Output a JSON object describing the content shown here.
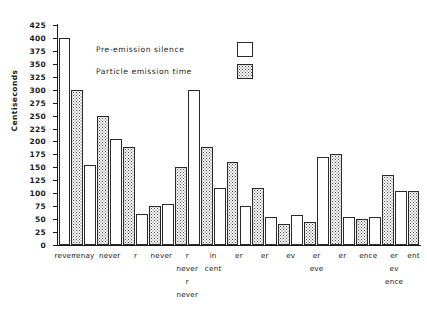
{
  "chart_data": {
    "type": "bar",
    "title": "",
    "xlabel": "",
    "ylabel": "Centiseconds",
    "ylim": [
      0,
      425
    ],
    "ytick_step": 25,
    "yticks": [
      0,
      25,
      50,
      75,
      100,
      125,
      150,
      175,
      200,
      225,
      250,
      275,
      300,
      325,
      350,
      375,
      400,
      425
    ],
    "ytick_labels": [
      "0",
      "25",
      "50",
      "75",
      "100",
      "125",
      "150",
      "175",
      "200",
      "225",
      "250",
      "275",
      "300",
      "325",
      "350",
      "375",
      "400",
      "425"
    ],
    "grid": false,
    "legend_position": "upper-center-inside",
    "categories": [
      "rever",
      "renay",
      "never",
      "r",
      "never",
      "r",
      "in",
      "er",
      "er",
      "ev",
      "er",
      "er",
      "ence",
      "er",
      "ent"
    ],
    "category_label_lines": [
      [
        "rever"
      ],
      [
        "renay"
      ],
      [
        "never"
      ],
      [
        "r"
      ],
      [
        "never"
      ],
      [
        "r",
        "never",
        "r",
        "never"
      ],
      [
        "in",
        "cent"
      ],
      [
        "er"
      ],
      [
        "er"
      ],
      [
        "ev"
      ],
      [
        "er",
        "eve"
      ],
      [
        "er"
      ],
      [
        "ence"
      ],
      [
        "er",
        "ev",
        "ence"
      ],
      [
        "ent"
      ]
    ],
    "series": [
      {
        "name": "Pre-emission silence",
        "fill": "white",
        "values": [
          400,
          155,
          205,
          60,
          80,
          300,
          110,
          75,
          55,
          58,
          170,
          55,
          135,
          null,
          null
        ]
      },
      {
        "name": "Particle emission time",
        "fill": "hatched",
        "values": [
          300,
          250,
          190,
          75,
          150,
          190,
          160,
          110,
          40,
          45,
          175,
          50,
          105,
          null,
          null
        ]
      }
    ],
    "bars": [
      {
        "index": 0,
        "label": "rever",
        "series": "Pre-emission silence",
        "value": 400
      },
      {
        "index": 1,
        "label": "renay",
        "series": "Particle emission time",
        "value": 300
      },
      {
        "index": 2,
        "label": "renay",
        "series": "Pre-emission silence",
        "value": 155
      },
      {
        "index": 3,
        "label": "never",
        "series": "Particle emission time",
        "value": 250
      },
      {
        "index": 4,
        "label": "never",
        "series": "Pre-emission silence",
        "value": 205
      },
      {
        "index": 5,
        "label": "r",
        "series": "Particle emission time",
        "value": 190
      },
      {
        "index": 6,
        "label": "never",
        "series": "Pre-emission silence",
        "value": 60
      },
      {
        "index": 7,
        "label": "never",
        "series": "Particle emission time",
        "value": 75
      },
      {
        "index": 8,
        "label": "r",
        "series": "Pre-emission silence",
        "value": 80
      },
      {
        "index": 9,
        "label": "r",
        "series": "Particle emission time",
        "value": 150
      },
      {
        "index": 10,
        "label": "in",
        "series": "Pre-emission silence",
        "value": 300
      },
      {
        "index": 11,
        "label": "in",
        "series": "Particle emission time",
        "value": 190
      },
      {
        "index": 12,
        "label": "er",
        "series": "Pre-emission silence",
        "value": 110
      },
      {
        "index": 13,
        "label": "er",
        "series": "Particle emission time",
        "value": 160
      },
      {
        "index": 14,
        "label": "er",
        "series": "Pre-emission silence",
        "value": 75
      },
      {
        "index": 15,
        "label": "er",
        "series": "Particle emission time",
        "value": 110
      },
      {
        "index": 16,
        "label": "ev",
        "series": "Pre-emission silence",
        "value": 55
      },
      {
        "index": 17,
        "label": "ev",
        "series": "Particle emission time",
        "value": 40
      },
      {
        "index": 18,
        "label": "er",
        "series": "Pre-emission silence",
        "value": 58
      },
      {
        "index": 19,
        "label": "er",
        "series": "Particle emission time",
        "value": 45
      },
      {
        "index": 20,
        "label": "er",
        "series": "Pre-emission silence",
        "value": 170
      },
      {
        "index": 21,
        "label": "er",
        "series": "Particle emission time",
        "value": 175
      },
      {
        "index": 22,
        "label": "ence",
        "series": "Pre-emission silence",
        "value": 55
      },
      {
        "index": 23,
        "label": "ence",
        "series": "Particle emission time",
        "value": 50
      },
      {
        "index": 24,
        "label": "er",
        "series": "Pre-emission silence",
        "value": 55
      },
      {
        "index": 25,
        "label": "er",
        "series": "Particle emission time",
        "value": 135
      },
      {
        "index": 26,
        "label": "ent",
        "series": "Pre-emission silence",
        "value": 105
      },
      {
        "index": 27,
        "label": "ent",
        "series": "Particle emission time",
        "value": 105
      }
    ]
  },
  "legend": {
    "items": [
      {
        "label": "Pre-emission silence",
        "swatch": "silence"
      },
      {
        "label": "Particle emission time",
        "swatch": "emission"
      }
    ]
  },
  "axis": {
    "y_title": "Centiseconds"
  },
  "colors": {
    "ink": "#1a1a1a",
    "bar_stroke": "#2a2a2a",
    "bar_fill_silence": "#ffffff",
    "bar_hatch_dot": "#4a4a4a",
    "background": "#ffffff"
  }
}
